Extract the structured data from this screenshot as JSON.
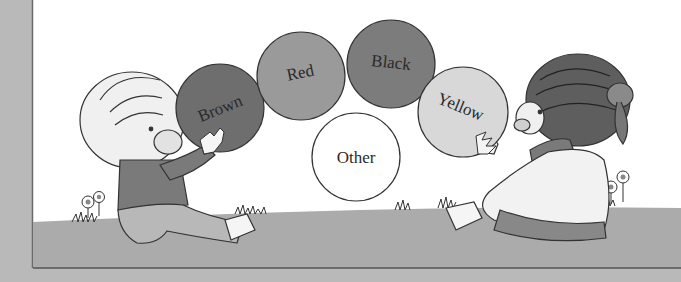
{
  "illustration": {
    "description": "Two cartoon children sitting on grass passing colored balls",
    "balls": [
      {
        "label": "Brown",
        "fill": "#6e6e6e",
        "cx": 220,
        "cy": 108,
        "r": 44,
        "rotate": -22
      },
      {
        "label": "Red",
        "fill": "#9a9a9a",
        "cx": 301,
        "cy": 76,
        "r": 44,
        "rotate": -12
      },
      {
        "label": "Black",
        "fill": "#7c7c7c",
        "cx": 391,
        "cy": 64,
        "r": 44,
        "rotate": 6
      },
      {
        "label": "Yellow",
        "fill": "#d8d8d8",
        "cx": 463,
        "cy": 112,
        "r": 45,
        "rotate": 22
      },
      {
        "label": "Other",
        "fill": "#ffffff",
        "cx": 356,
        "cy": 157,
        "r": 44,
        "rotate": 0
      }
    ],
    "colors": {
      "frame_gray": "#b9b9b9",
      "sky": "#ffffff",
      "grass": "#a9a9a9",
      "line": "#555555"
    }
  }
}
